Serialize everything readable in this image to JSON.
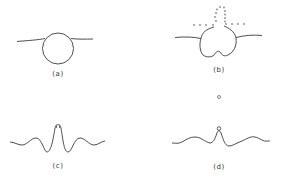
{
  "figure": {
    "stroke_color": "#3a3a3a",
    "dot_color": "#888888",
    "panels": [
      {
        "id": "a",
        "label": "(a)",
        "description": "Bubble (circle) attached beneath a nearly flat surface line"
      },
      {
        "id": "b",
        "label": "(b)",
        "description": "Bubble deforming with a notch at the bottom; dotted outline shows a jet/droplets rising above the surface"
      },
      {
        "id": "c",
        "label": "(c)",
        "description": "Wavy surface with a tall central jet peak"
      },
      {
        "id": "d",
        "label": "(d)",
        "description": "Wavy surface with central peak ejecting a small droplet; a second droplet above"
      }
    ]
  }
}
